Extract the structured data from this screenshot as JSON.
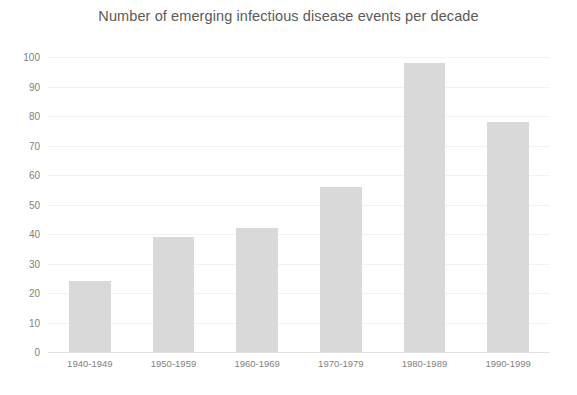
{
  "chart_data": {
    "type": "bar",
    "title": "Number of emerging infectious disease events per decade",
    "title_line1": "Number of emerging infectious disease events per",
    "title_line2": "decade",
    "xlabel": "",
    "ylabel": "",
    "categories": [
      "1940-1949",
      "1950-1959",
      "1960-1969",
      "1970-1979",
      "1980-1989",
      "1990-1999"
    ],
    "values": [
      24,
      39,
      42,
      56,
      98,
      78
    ],
    "ylim": [
      0,
      100
    ],
    "yticks": [
      0,
      10,
      20,
      30,
      40,
      50,
      60,
      70,
      80,
      90,
      100
    ],
    "ytick_labels": [
      "0",
      "10",
      "20",
      "30",
      "40",
      "50",
      "60",
      "70",
      "80",
      "90",
      "100"
    ],
    "grid": true,
    "legend": false,
    "legend_position": "none",
    "bar_color": "#d9d9d9",
    "gridline_color": "#f2f2f2",
    "axis_color": "#e2e2e2",
    "title_color": "#5a5a5a",
    "tick_label_color": "#7f7f7f",
    "background_color": "#ffffff"
  }
}
